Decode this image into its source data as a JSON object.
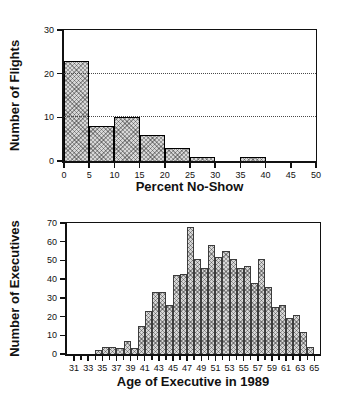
{
  "page": {
    "background": "#ffffff",
    "line_color": "#111111",
    "bar_fill": "#d7d7d7",
    "bar_pattern": "gray-stipple-crosshatch"
  },
  "chart_data": [
    {
      "type": "bar",
      "title": "",
      "xlabel": "Percent No-Show",
      "ylabel": "Number of Flights",
      "bin_start": 0,
      "bin_width": 5,
      "categories": [
        "0-5",
        "5-10",
        "10-15",
        "15-20",
        "20-25",
        "25-30",
        "30-35",
        "35-40",
        "40-45",
        "45-50"
      ],
      "values": [
        23,
        8,
        10,
        6,
        3,
        1,
        0,
        1,
        0,
        0
      ],
      "xlim": [
        0,
        50
      ],
      "ylim": [
        0,
        30
      ],
      "x_ticks": [
        0,
        5,
        10,
        15,
        20,
        25,
        30,
        35,
        40,
        45,
        50
      ],
      "x_minor_ticks": [],
      "y_ticks": [
        0,
        10,
        20,
        30
      ],
      "grid_y": [
        10,
        20
      ],
      "grid_style": "dotted horizontal",
      "legend": "none"
    },
    {
      "type": "bar",
      "title": "",
      "xlabel": "Age of Executive in 1989",
      "ylabel": "Number of Executives",
      "bin_start": 34,
      "bin_width": 1,
      "categories": [
        34,
        35,
        36,
        37,
        38,
        39,
        40,
        41,
        42,
        43,
        44,
        45,
        46,
        47,
        48,
        49,
        50,
        51,
        52,
        53,
        54,
        55,
        56,
        57,
        58,
        59,
        60,
        61,
        62,
        63,
        64
      ],
      "values": [
        2,
        4,
        4,
        3,
        7,
        3,
        15,
        23,
        33,
        33,
        26,
        42,
        43,
        68,
        51,
        46,
        58,
        52,
        55,
        51,
        46,
        47,
        38,
        51,
        36,
        25,
        26,
        19,
        21,
        12,
        4
      ],
      "xlim": [
        30,
        65.8
      ],
      "ylim": [
        0,
        70
      ],
      "x_ticks": [
        31,
        33,
        35,
        37,
        39,
        41,
        43,
        45,
        47,
        49,
        51,
        53,
        55,
        57,
        59,
        61,
        63,
        65
      ],
      "x_minor_ticks": [
        32,
        34,
        36,
        38,
        40,
        42,
        44,
        46,
        48,
        50,
        52,
        54,
        56,
        58,
        60,
        62,
        64
      ],
      "y_ticks": [
        0,
        10,
        20,
        30,
        40,
        50,
        60,
        70
      ],
      "grid_y": [],
      "grid_style": "none",
      "legend": "none"
    }
  ]
}
